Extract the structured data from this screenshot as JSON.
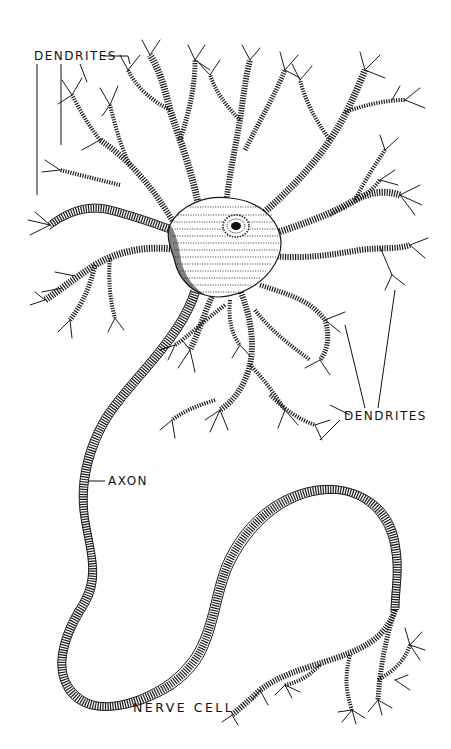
{
  "figure": {
    "title": "NERVE CELL",
    "style": "black-and-white pen-and-ink engraving"
  },
  "labels": {
    "dendrites_top": "DENDRITES",
    "dendrites_right": "DENDRITES",
    "axon": "AXON",
    "caption": "NERVE CELL"
  },
  "parts": [
    {
      "name": "cell body",
      "description": "central soma with stippled cytoplasm"
    },
    {
      "name": "nucleus",
      "description": "dark nucleolus surrounded by stippled ring"
    },
    {
      "name": "dendrites",
      "description": "branching processes radiating from cell body"
    },
    {
      "name": "axon",
      "description": "long process looping down and to the right"
    },
    {
      "name": "axon terminals",
      "description": "branching endings at lower right"
    }
  ],
  "colors": {
    "ink": "#1a1a1a",
    "background": "#ffffff"
  }
}
